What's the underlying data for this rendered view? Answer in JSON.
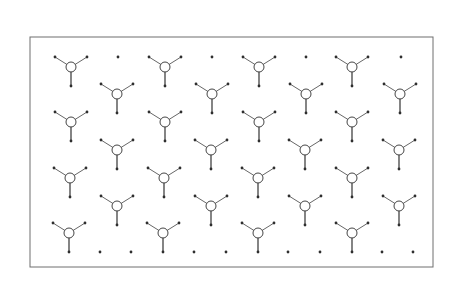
{
  "figure": {
    "width": 457,
    "height": 297,
    "frame": {
      "x": 30,
      "y": 37,
      "width": 403,
      "height": 230
    },
    "colors": {
      "background": "#ffffff",
      "frame": "#6e6e6e",
      "bond": "#555555",
      "atom": "#2e2e2e",
      "center_stroke": "#444444"
    },
    "unit_geometry": {
      "center_radius": 5,
      "arm_dx": 16,
      "arm_dy": -10,
      "stem_dy": 19,
      "terminal_radius": 1.4
    },
    "units": [
      {
        "x": 71,
        "y": 67
      },
      {
        "x": 165,
        "y": 67
      },
      {
        "x": 259,
        "y": 67
      },
      {
        "x": 352,
        "y": 67
      },
      {
        "x": 117,
        "y": 94
      },
      {
        "x": 212,
        "y": 94
      },
      {
        "x": 306,
        "y": 94
      },
      {
        "x": 400,
        "y": 94
      },
      {
        "x": 71,
        "y": 122
      },
      {
        "x": 165,
        "y": 122
      },
      {
        "x": 259,
        "y": 122
      },
      {
        "x": 352,
        "y": 122
      },
      {
        "x": 117,
        "y": 150
      },
      {
        "x": 211,
        "y": 150
      },
      {
        "x": 305,
        "y": 150
      },
      {
        "x": 399,
        "y": 150
      },
      {
        "x": 70,
        "y": 178
      },
      {
        "x": 164,
        "y": 178
      },
      {
        "x": 258,
        "y": 178
      },
      {
        "x": 352,
        "y": 178
      },
      {
        "x": 117,
        "y": 206
      },
      {
        "x": 211,
        "y": 206
      },
      {
        "x": 305,
        "y": 206
      },
      {
        "x": 399,
        "y": 206
      },
      {
        "x": 69,
        "y": 233
      },
      {
        "x": 163,
        "y": 233
      },
      {
        "x": 258,
        "y": 233
      },
      {
        "x": 352,
        "y": 233
      }
    ],
    "isolated_dots": [
      {
        "x": 118,
        "y": 57
      },
      {
        "x": 212,
        "y": 57
      },
      {
        "x": 306,
        "y": 57
      },
      {
        "x": 401,
        "y": 57
      },
      {
        "x": 100,
        "y": 252
      },
      {
        "x": 131,
        "y": 252
      },
      {
        "x": 194,
        "y": 252
      },
      {
        "x": 226,
        "y": 252
      },
      {
        "x": 288,
        "y": 252
      },
      {
        "x": 320,
        "y": 252
      },
      {
        "x": 382,
        "y": 252
      },
      {
        "x": 413,
        "y": 252
      }
    ]
  }
}
